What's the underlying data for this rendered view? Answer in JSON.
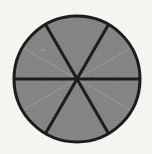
{
  "figure": {
    "name": "fraction-circle",
    "shape": "circle",
    "sector_count": 6,
    "sector_angle_degrees": 60,
    "shaded_sectors": 6,
    "unshaded_sectors": 0,
    "fraction_shaded": "6/6",
    "background_color": "#f7f6f3",
    "fill_color": "#848484",
    "line_color": "#1a1a1a",
    "outline_width": 3,
    "divider_width": 3,
    "center_x": 77,
    "center_y": 79,
    "radius": 63,
    "divider_angles_degrees": [
      90,
      30,
      150
    ],
    "labels": [],
    "title": "",
    "caption": ""
  },
  "chart_data": {
    "type": "pie",
    "title": "",
    "categories": [
      "Sector 1",
      "Sector 2",
      "Sector 3",
      "Sector 4",
      "Sector 5",
      "Sector 6"
    ],
    "values": [
      1,
      1,
      1,
      1,
      1,
      1
    ],
    "percentages": [
      16.67,
      16.67,
      16.67,
      16.67,
      16.67,
      16.67
    ],
    "colors": [
      "#848484",
      "#848484",
      "#848484",
      "#848484",
      "#848484",
      "#848484"
    ],
    "legend": [],
    "legend_position": "none",
    "grid": false,
    "xlabel": "",
    "ylabel": "",
    "annotations": []
  }
}
